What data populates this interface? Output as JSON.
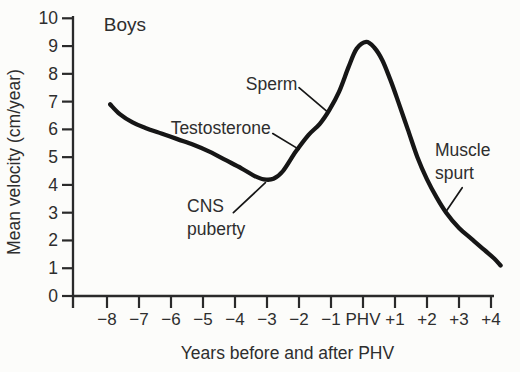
{
  "figure": {
    "background": "#fcfcfa",
    "ink": "#161616",
    "axis_color": "#2a2a2a",
    "text_color": "#2e2e2e"
  },
  "chart_data": {
    "type": "line",
    "title": "",
    "group_label": "Boys",
    "xlabel": "Years before and after PHV",
    "ylabel": "Mean velocity (cm/year)",
    "grid": false,
    "legend": "none",
    "xlim": [
      -9.06,
      4.1
    ],
    "ylim": [
      0,
      10
    ],
    "x_tick_values": [
      -8,
      -7,
      -6,
      -5,
      -4,
      -3,
      -2,
      -1,
      0,
      1,
      2,
      3,
      4
    ],
    "x_tick_labels": [
      "−8",
      "−7",
      "−6",
      "−5",
      "−4",
      "−3",
      "−2",
      "−1",
      "PHV",
      "+1",
      "+2",
      "+3",
      "+4"
    ],
    "y_tick_values": [
      0,
      1,
      2,
      3,
      4,
      5,
      6,
      7,
      8,
      9,
      10
    ],
    "y_tick_labels": [
      "0",
      "1",
      "2",
      "3",
      "4",
      "5",
      "6",
      "7",
      "8",
      "9",
      "10"
    ],
    "series": [
      {
        "name": "mean growth velocity (boys)",
        "points": [
          [
            -7.9,
            6.9
          ],
          [
            -7.6,
            6.55
          ],
          [
            -7.2,
            6.25
          ],
          [
            -6.8,
            6.05
          ],
          [
            -6.3,
            5.85
          ],
          [
            -5.8,
            5.65
          ],
          [
            -5.3,
            5.45
          ],
          [
            -4.8,
            5.2
          ],
          [
            -4.3,
            4.9
          ],
          [
            -3.8,
            4.6
          ],
          [
            -3.4,
            4.33
          ],
          [
            -3.1,
            4.2
          ],
          [
            -2.8,
            4.22
          ],
          [
            -2.5,
            4.5
          ],
          [
            -2.1,
            5.2
          ],
          [
            -1.7,
            5.8
          ],
          [
            -1.35,
            6.2
          ],
          [
            -1.05,
            6.7
          ],
          [
            -0.75,
            7.35
          ],
          [
            -0.45,
            8.25
          ],
          [
            -0.2,
            8.9
          ],
          [
            0.1,
            9.15
          ],
          [
            0.35,
            8.95
          ],
          [
            0.6,
            8.5
          ],
          [
            0.85,
            7.8
          ],
          [
            1.1,
            7.0
          ],
          [
            1.4,
            6.0
          ],
          [
            1.7,
            5.0
          ],
          [
            2.0,
            4.2
          ],
          [
            2.3,
            3.55
          ],
          [
            2.6,
            3.0
          ],
          [
            3.0,
            2.45
          ],
          [
            3.4,
            2.05
          ],
          [
            3.8,
            1.65
          ],
          [
            4.1,
            1.35
          ],
          [
            4.3,
            1.1
          ]
        ]
      }
    ],
    "annotations": [
      {
        "id": "testosterone",
        "lines": [
          "Testosterone"
        ],
        "x": -2.88,
        "y": 6.05,
        "anchor": "end",
        "leader": {
          "x1": -2.82,
          "y1": 5.85,
          "x2": -2.0,
          "y2": 5.28
        }
      },
      {
        "id": "sperm",
        "lines": [
          "Sperm"
        ],
        "x": -2.05,
        "y": 7.65,
        "anchor": "end",
        "leader": {
          "x1": -2.0,
          "y1": 7.5,
          "x2": -1.1,
          "y2": 6.62
        }
      },
      {
        "id": "cns-puberty",
        "lines": [
          "CNS",
          "puberty"
        ],
        "x": -5.5,
        "y": 3.25,
        "anchor": "start",
        "leader": {
          "x1": -4.05,
          "y1": 3.0,
          "x2": -3.05,
          "y2": 4.08
        }
      },
      {
        "id": "muscle-spurt",
        "lines": [
          "Muscle",
          "spurt"
        ],
        "x": 2.25,
        "y": 5.25,
        "anchor": "start",
        "leader": {
          "x1": 3.1,
          "y1": 3.9,
          "x2": 2.6,
          "y2": 3.05
        }
      }
    ]
  }
}
